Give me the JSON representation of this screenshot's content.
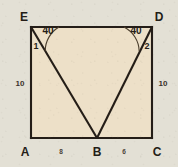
{
  "figure": {
    "type": "geometry-diagram",
    "shape": "quadrilateral-with-inscribed-triangle",
    "vertices": [
      {
        "id": "E",
        "label": "E",
        "position": "top-left"
      },
      {
        "id": "D",
        "label": "D",
        "position": "top-right"
      },
      {
        "id": "A",
        "label": "A",
        "position": "bottom-left"
      },
      {
        "id": "B",
        "label": "B",
        "position": "bottom-middle"
      },
      {
        "id": "C",
        "label": "C",
        "position": "bottom-right"
      }
    ],
    "angles": [
      {
        "at": "E",
        "value": "40",
        "name": "1",
        "unit": "degrees"
      },
      {
        "at": "D",
        "value": "40",
        "name": "2",
        "unit": "degrees"
      }
    ],
    "sides": [
      {
        "id": "AE",
        "label": "10",
        "position": "left"
      },
      {
        "id": "CD",
        "label": "10",
        "position": "right"
      },
      {
        "id": "AB",
        "label": "8",
        "position": "bottom-left"
      },
      {
        "id": "BC",
        "label": "6",
        "position": "bottom-right"
      }
    ],
    "colors": {
      "interior_fill": "#ede0c8",
      "background": "#e3e0d5",
      "stroke": "#241d17",
      "arc_stroke": "#4a3d2c"
    }
  }
}
